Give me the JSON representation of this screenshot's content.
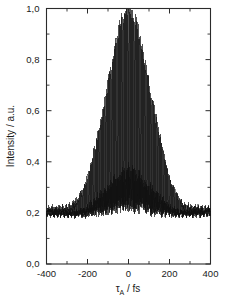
{
  "figure": {
    "background_color": "#ffffff",
    "line_color": "#111111",
    "axis_color": "#2b2b2b"
  },
  "axes": {
    "x": {
      "label_main": "τ",
      "label_sub": "A",
      "label_tail": " / fs",
      "label_full": "τ_A / fs",
      "min": -400,
      "max": 400,
      "major_ticks": [
        -400,
        -200,
        0,
        200,
        400
      ],
      "major_tick_labels": [
        "-400",
        "-200",
        "0",
        "200",
        "400"
      ],
      "minor_ticks": [
        -300,
        -100,
        100,
        300
      ]
    },
    "y": {
      "label": "Intensity / a.u.",
      "min": 0.0,
      "max": 1.0,
      "major_ticks": [
        0.0,
        0.2,
        0.4,
        0.6,
        0.8,
        1.0
      ],
      "major_tick_labels": [
        "0,0",
        "0,2",
        "0,4",
        "0,6",
        "0,8",
        "1,0"
      ],
      "minor_ticks": [
        0.1,
        0.3,
        0.5,
        0.7,
        0.9
      ]
    }
  },
  "chart_data": {
    "type": "line",
    "title": "",
    "xlabel": "τ_A / fs",
    "ylabel": "Intensity / a.u.",
    "xlim": [
      -400,
      400
    ],
    "ylim": [
      0.0,
      1.0
    ],
    "grid": false,
    "legend": false,
    "baseline": 0.2,
    "peak_value": 1.0,
    "peak_position_fs": 0,
    "fringe_period_fs": 2.67,
    "envelope_fwhm_fs": 120,
    "envelope_type": "gaussian",
    "noise_amplitude": 0.012,
    "upper_envelope": {
      "x": [
        -400,
        -350,
        -300,
        -280,
        -260,
        -240,
        -220,
        -200,
        -180,
        -160,
        -140,
        -120,
        -100,
        -80,
        -60,
        -40,
        -20,
        0,
        20,
        40,
        60,
        80,
        100,
        120,
        140,
        160,
        180,
        200,
        220,
        240,
        260,
        280,
        300,
        350,
        400
      ],
      "y": [
        0.215,
        0.218,
        0.222,
        0.228,
        0.24,
        0.262,
        0.295,
        0.34,
        0.4,
        0.47,
        0.545,
        0.625,
        0.705,
        0.79,
        0.87,
        0.935,
        0.982,
        1.0,
        0.985,
        0.94,
        0.875,
        0.795,
        0.71,
        0.628,
        0.548,
        0.472,
        0.402,
        0.342,
        0.296,
        0.263,
        0.241,
        0.229,
        0.223,
        0.218,
        0.214
      ]
    },
    "lower_envelope": {
      "x": [
        -400,
        -350,
        -300,
        -280,
        -260,
        -240,
        -220,
        -200,
        -180,
        -160,
        -140,
        -120,
        -100,
        -80,
        -60,
        -40,
        -20,
        0,
        20,
        40,
        60,
        80,
        100,
        120,
        140,
        160,
        180,
        200,
        220,
        240,
        260,
        280,
        300,
        350,
        400
      ],
      "y": [
        0.192,
        0.19,
        0.188,
        0.186,
        0.182,
        0.176,
        0.167,
        0.155,
        0.14,
        0.124,
        0.107,
        0.09,
        0.074,
        0.059,
        0.045,
        0.033,
        0.025,
        0.022,
        0.025,
        0.033,
        0.046,
        0.06,
        0.075,
        0.091,
        0.108,
        0.125,
        0.141,
        0.156,
        0.168,
        0.177,
        0.183,
        0.187,
        0.189,
        0.191,
        0.193
      ]
    },
    "mid_envelope": {
      "x": [
        -400,
        -300,
        -250,
        -200,
        -150,
        -100,
        -50,
        0,
        50,
        100,
        150,
        200,
        250,
        300,
        400
      ],
      "y": [
        0.204,
        0.205,
        0.21,
        0.248,
        0.318,
        0.39,
        0.47,
        0.511,
        0.468,
        0.392,
        0.32,
        0.249,
        0.211,
        0.206,
        0.204
      ]
    }
  }
}
